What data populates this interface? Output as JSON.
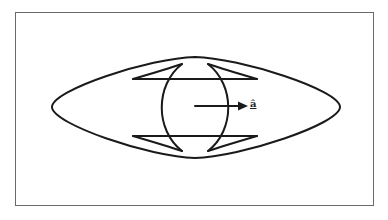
{
  "figure": {
    "vector_label": "â",
    "stroke_color": "#1a1a1a",
    "frame_color": "#6a6a6a",
    "background": "#ffffff"
  }
}
